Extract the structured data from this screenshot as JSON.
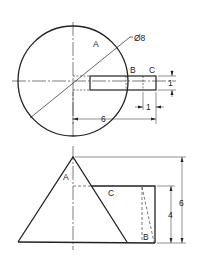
{
  "diagram": {
    "top_view": {
      "labels": {
        "A": "A",
        "B": "B",
        "C": "C",
        "diameter": "Ø8"
      },
      "dimensions": {
        "slot_width": "1",
        "slot_length_overall": "6",
        "slot_end_offset": "1"
      }
    },
    "front_view": {
      "labels": {
        "A": "A",
        "B": "B",
        "C": "C"
      },
      "dimensions": {
        "total_height": "6",
        "block_height": "4"
      }
    },
    "colors": {
      "line": "#222222",
      "background": "#ffffff"
    }
  }
}
